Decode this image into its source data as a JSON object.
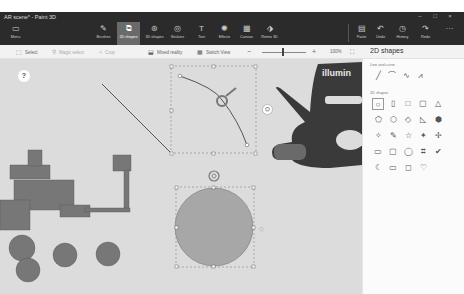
{
  "window": {
    "title": "AR scene* - Paint 3D",
    "controls": [
      "–",
      "□",
      "×"
    ]
  },
  "toolbar": {
    "menu": {
      "label": "Menu",
      "icon": "folder-icon"
    },
    "tools": [
      {
        "label": "Brushes",
        "icon": "brush-icon"
      },
      {
        "label": "2D shapes",
        "icon": "2d-shapes-icon",
        "active": true
      },
      {
        "label": "3D shapes",
        "icon": "3d-shapes-icon"
      },
      {
        "label": "Stickers",
        "icon": "stickers-icon"
      },
      {
        "label": "Text",
        "icon": "text-icon"
      },
      {
        "label": "Effects",
        "icon": "effects-icon"
      },
      {
        "label": "Canvas",
        "icon": "canvas-icon"
      },
      {
        "label": "Remix 3D",
        "icon": "remix-3d-icon"
      }
    ],
    "right": [
      {
        "label": "Paste",
        "icon": "paste-icon"
      },
      {
        "label": "Undo",
        "icon": "undo-icon"
      },
      {
        "label": "History",
        "icon": "history-icon"
      },
      {
        "label": "Redo",
        "icon": "redo-icon"
      }
    ],
    "more": "···"
  },
  "subbar": {
    "select": "Select",
    "magic_select": "Magic select",
    "crop": "Crop",
    "mixed_reality": "Mixed reality",
    "switch_view": "Switch View",
    "zoom_minus": "−",
    "zoom_plus": "+",
    "zoom_level": "100%"
  },
  "side_panel": {
    "title": "2D shapes",
    "lines_section": "Line and curve",
    "lines": [
      "╱",
      "⌒",
      "∿",
      "⩘"
    ],
    "shapes_section": "2D shapes",
    "shapes": [
      [
        "○",
        "▯",
        "□",
        "▢",
        "△"
      ],
      [
        "⬠",
        "⬡",
        "◇",
        "◺",
        "⬢"
      ],
      [
        "✧",
        "✎",
        "☆",
        "✦",
        "✢"
      ],
      [
        "▭",
        "▢",
        "◯",
        "⌗",
        "✔"
      ],
      [
        "☾",
        "▭",
        "◻",
        "♡",
        ""
      ]
    ]
  },
  "canvas": {
    "help": "?",
    "sticker_label": "⛭"
  }
}
